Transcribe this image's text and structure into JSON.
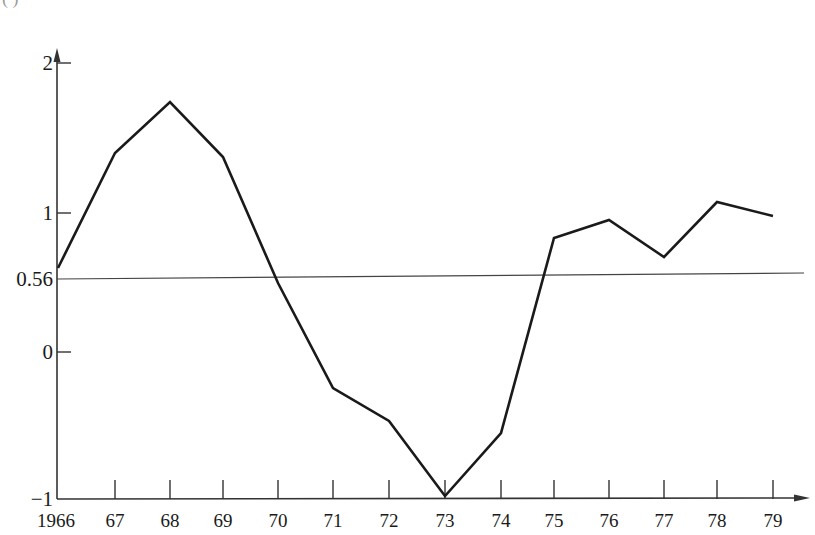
{
  "header": {
    "clipped_label": "(     )"
  },
  "chart_data": {
    "type": "line",
    "title": "",
    "xlabel": "",
    "ylabel": "",
    "categories": [
      "1966",
      "67",
      "68",
      "69",
      "70",
      "71",
      "72",
      "73",
      "74",
      "75",
      "76",
      "77",
      "78",
      "79"
    ],
    "x": [
      1966,
      1967,
      1968,
      1969,
      1970,
      1971,
      1972,
      1973,
      1974,
      1975,
      1976,
      1977,
      1978,
      1979
    ],
    "series": [
      {
        "name": "series",
        "values": [
          0.6,
          1.43,
          1.8,
          1.4,
          0.5,
          -0.25,
          -0.47,
          -0.98,
          -0.55,
          0.82,
          0.95,
          0.68,
          1.08,
          0.98
        ]
      }
    ],
    "reference_line": {
      "value": 0.56,
      "label": "0.56"
    },
    "y_ticks": [
      {
        "value": 2,
        "label": "2"
      },
      {
        "value": 1,
        "label": "1"
      },
      {
        "value": 0.56,
        "label": "0.56"
      },
      {
        "value": 0,
        "label": "0"
      },
      {
        "value": -1,
        "label": "−1"
      }
    ],
    "ylim": [
      -1,
      2.2
    ],
    "grid": false,
    "legend": "none",
    "colors": {
      "line": "#1a1a1a",
      "axis": "#333333",
      "reference": "#444444"
    }
  },
  "layout": {
    "axis_x": 57,
    "axis_y_bottom": 499,
    "axis_top": 48,
    "axis_right": 808,
    "x_px": [
      58,
      115,
      170,
      223,
      278,
      333,
      389,
      445,
      501,
      554,
      609,
      664,
      717,
      773
    ],
    "y_px_for_values": [
      268,
      153,
      102,
      157,
      283,
      388,
      421,
      496,
      433,
      238,
      220,
      257,
      202,
      216
    ],
    "y_tick_px": {
      "2": 63,
      "1": 213,
      "0.56": 279,
      "0": 352,
      "-1": 499
    },
    "reference_line_px": {
      "x1": 57,
      "y1": 279,
      "x2": 804,
      "y2": 273
    }
  }
}
